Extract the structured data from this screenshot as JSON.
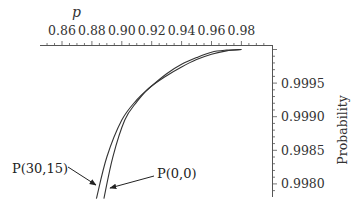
{
  "chart_data": {
    "type": "line",
    "title": "",
    "xlabel": "p",
    "ylabel": "Probability",
    "x_axis_position": "top",
    "y_axis_position": "right",
    "xlim": [
      0.845,
      0.995
    ],
    "ylim": [
      0.99775,
      1.0
    ],
    "x_ticks": [
      "0.86",
      "0.88",
      "0.90",
      "0.92",
      "0.94",
      "0.96",
      "0.98"
    ],
    "y_ticks": [
      "0.9995",
      "0.9990",
      "0.9985",
      "0.9980"
    ],
    "grid": false,
    "legend": null,
    "series": [
      {
        "name": "P(30,15)",
        "x": [
          0.883,
          0.89,
          0.9,
          0.91,
          0.918,
          0.93,
          0.94,
          0.95,
          0.96,
          0.97,
          0.98
        ],
        "y": [
          0.99778,
          0.9984,
          0.99895,
          0.99925,
          0.99942,
          0.99964,
          0.99978,
          0.99988,
          0.99996,
          0.99999,
          1.0
        ]
      },
      {
        "name": "P(0,0)",
        "x": [
          0.888,
          0.894,
          0.902,
          0.91,
          0.918,
          0.93,
          0.94,
          0.95,
          0.96,
          0.97,
          0.98
        ],
        "y": [
          0.99778,
          0.9984,
          0.99895,
          0.99922,
          0.99942,
          0.99961,
          0.99974,
          0.99985,
          0.99993,
          0.99998,
          1.0
        ]
      }
    ],
    "annotations": [
      {
        "text": "P(30,15)",
        "arrow_to_series": "P(30,15)"
      },
      {
        "text": "P(0,0)",
        "arrow_to_series": "P(0,0)"
      }
    ]
  },
  "labels": {
    "x_title": "p",
    "y_title": "Probability",
    "ann_left": "P(30,15)",
    "ann_right": "P(0,0)"
  }
}
